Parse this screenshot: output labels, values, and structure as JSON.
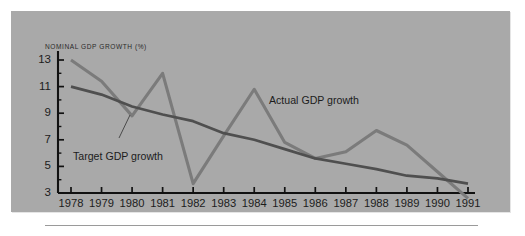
{
  "figure": {
    "background_color": "#ffffff",
    "panel_color": "#a9a9a9",
    "bottom_rule": "horizontal-rule"
  },
  "chart_data": {
    "type": "line",
    "title": "NOMINAL GDP GROWTH (%)",
    "xlabel": "",
    "ylabel": "NOMINAL GDP GROWTH (%)",
    "xlim": [
      1978,
      1991
    ],
    "ylim": [
      3,
      13
    ],
    "grid": false,
    "legend_position": "inline-annotations",
    "x": [
      1978,
      1979,
      1980,
      1981,
      1982,
      1983,
      1984,
      1985,
      1986,
      1987,
      1988,
      1989,
      1990,
      1991
    ],
    "xticks": [
      "1978",
      "1979",
      "1980",
      "1981",
      "1982",
      "1983",
      "1984",
      "1985",
      "1986",
      "1987",
      "1988",
      "1989",
      "1990",
      "1991"
    ],
    "yticks": [
      "13",
      "11",
      "9",
      "7",
      "5",
      "3"
    ],
    "ytick_values": [
      13,
      11,
      9,
      7,
      5,
      3
    ],
    "y_minor_ticks": [
      12,
      10,
      8,
      6,
      4
    ],
    "series": [
      {
        "name": "Actual GDP growth",
        "color": "#7b7b7b",
        "line_width": 3.1,
        "annotation": "Actual GDP growth",
        "values": [
          13.0,
          11.4,
          8.8,
          12.0,
          3.7,
          7.3,
          10.8,
          6.8,
          5.6,
          6.1,
          7.7,
          6.6,
          4.6,
          2.6
        ]
      },
      {
        "name": "Target GDP growth",
        "color": "#4f4f4f",
        "line_width": 2.7,
        "annotation": "Target GDP growth",
        "values": [
          11.0,
          10.4,
          9.5,
          8.9,
          8.4,
          7.5,
          7.0,
          6.3,
          5.6,
          5.2,
          4.8,
          4.3,
          4.1,
          3.7
        ]
      }
    ],
    "annotations": [
      {
        "text": "Actual GDP growth",
        "target_series": "Actual GDP growth",
        "x": 1985.1,
        "y": 10.6
      },
      {
        "text": "Target GDP growth",
        "target_series": "Target GDP growth",
        "x": 1978.4,
        "y": 6.6,
        "leader_line": true
      }
    ]
  }
}
